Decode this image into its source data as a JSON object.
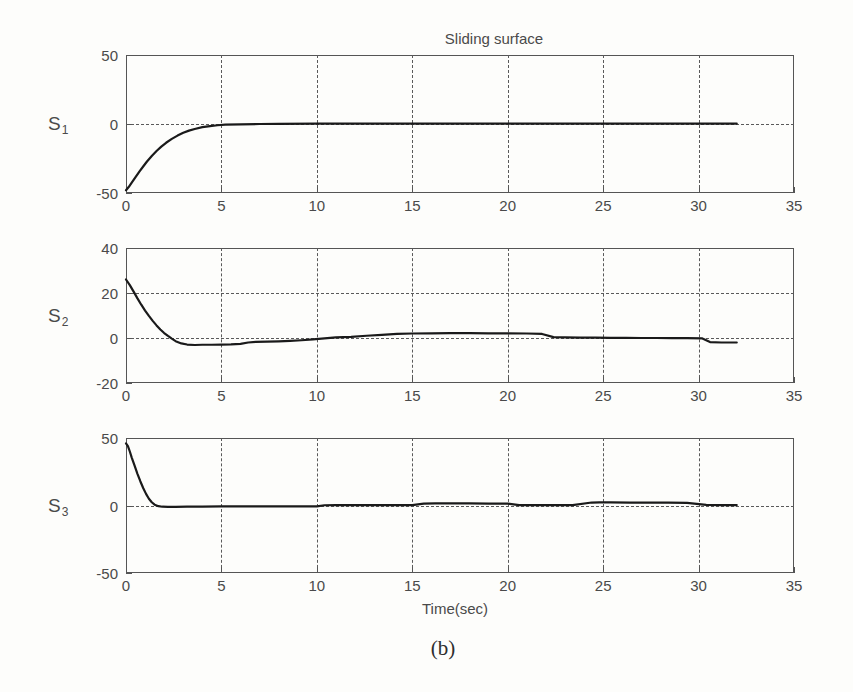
{
  "figure": {
    "title": "Sliding surface",
    "caption": "(b)",
    "xlabel": "Time(sec)"
  },
  "chart_data": {
    "type": "line",
    "title": "Sliding surface",
    "caption": "(b)",
    "xlabel": "Time(sec)",
    "ylabel": "",
    "shared_x": true,
    "xlim": [
      0,
      35
    ],
    "xticks": [
      0,
      5,
      10,
      15,
      20,
      25,
      30,
      35
    ],
    "xticklabels": [
      "0",
      "5",
      "10",
      "15",
      "20",
      "25",
      "30",
      "35"
    ],
    "grid": "dashed",
    "legend": "none",
    "subplots": [
      {
        "name": "S1",
        "ylabel": "S",
        "ylabel_sub": "1",
        "ylim": [
          -50,
          50
        ],
        "yticks": [
          -50,
          0,
          50
        ],
        "yticklabels": [
          "-50",
          "0",
          "50"
        ],
        "series": [
          {
            "name": "S1",
            "x": [
              0,
              0.15,
              0.3,
              0.5,
              0.7,
              0.9,
              1.1,
              1.35,
              1.6,
              1.85,
              2.1,
              2.4,
              2.7,
              3.0,
              3.3,
              3.6,
              4.0,
              4.4,
              4.8,
              5.2,
              6.0,
              7.0,
              8.0,
              10.0,
              12.0,
              14.0,
              16.0,
              18.0,
              20.0,
              22.0,
              24.0,
              26.0,
              28.0,
              30.0,
              31.0,
              32.0
            ],
            "y": [
              -48.0,
              -45.5,
              -42.5,
              -38.5,
              -34.5,
              -30.8,
              -27.2,
              -23.2,
              -19.6,
              -16.4,
              -13.6,
              -10.8,
              -8.4,
              -6.4,
              -4.8,
              -3.6,
              -2.3,
              -1.5,
              -0.9,
              -0.5,
              -0.2,
              0.0,
              0.1,
              0.2,
              0.2,
              0.2,
              0.2,
              0.3,
              0.2,
              0.2,
              0.2,
              0.2,
              0.2,
              0.2,
              0.2,
              0.2
            ]
          }
        ]
      },
      {
        "name": "S2",
        "ylabel": "S",
        "ylabel_sub": "2",
        "ylim": [
          -20,
          40
        ],
        "yticks": [
          -20,
          0,
          20,
          40
        ],
        "yticklabels": [
          "-20",
          "0",
          "20",
          "40"
        ],
        "series": [
          {
            "name": "S2",
            "x": [
              0,
              0.2,
              0.4,
              0.6,
              0.8,
              1.0,
              1.2,
              1.4,
              1.6,
              1.8,
              2.0,
              2.2,
              2.4,
              2.6,
              2.9,
              3.2,
              3.6,
              4.0,
              4.5,
              5.0,
              5.5,
              6.0,
              6.4,
              6.8,
              7.4,
              8.0,
              8.6,
              9.2,
              9.8,
              10.4,
              11.0,
              11.8,
              12.6,
              13.4,
              14.2,
              15.0,
              16.0,
              17.0,
              18.0,
              19.0,
              20.0,
              21.0,
              21.8,
              22.4,
              23.0,
              23.8,
              24.6,
              25.4,
              26.2,
              27.0,
              27.8,
              28.6,
              29.4,
              30.2,
              30.6,
              31.2,
              32.0
            ],
            "y": [
              26.0,
              23.5,
              20.6,
              17.6,
              14.8,
              12.2,
              9.8,
              7.6,
              5.6,
              3.8,
              2.2,
              0.9,
              -0.3,
              -1.4,
              -2.4,
              -2.9,
              -3.1,
              -3.0,
              -3.0,
              -2.9,
              -2.8,
              -2.6,
              -2.0,
              -1.7,
              -1.6,
              -1.5,
              -1.3,
              -1.0,
              -0.6,
              -0.2,
              0.3,
              0.5,
              1.0,
              1.4,
              1.8,
              2.0,
              2.1,
              2.2,
              2.2,
              2.1,
              2.1,
              2.0,
              1.8,
              0.4,
              0.3,
              0.2,
              0.2,
              0.1,
              0.1,
              0.0,
              0.0,
              -0.1,
              -0.1,
              -0.2,
              -1.8,
              -2.0,
              -2.0
            ]
          }
        ]
      },
      {
        "name": "S3",
        "ylabel": "S",
        "ylabel_sub": "3",
        "ylim": [
          -50,
          50
        ],
        "yticks": [
          -50,
          0,
          50
        ],
        "yticklabels": [
          "-50",
          "0",
          "50"
        ],
        "series": [
          {
            "name": "S3",
            "x": [
              0,
              0.1,
              0.2,
              0.3,
              0.45,
              0.6,
              0.75,
              0.9,
              1.05,
              1.2,
              1.35,
              1.5,
              1.7,
              1.9,
              2.2,
              2.6,
              3.2,
              4.0,
              5.0,
              6.0,
              7.5,
              9.0,
              10.0,
              10.4,
              11.0,
              12.0,
              13.0,
              14.0,
              15.0,
              15.6,
              16.2,
              17.0,
              18.0,
              19.0,
              20.0,
              20.6,
              21.4,
              22.4,
              23.4,
              24.4,
              24.8,
              25.4,
              26.4,
              27.4,
              28.4,
              29.4,
              30.4,
              31.2,
              32.0
            ],
            "y": [
              46.0,
              44.0,
              40.0,
              35.5,
              29.5,
              23.5,
              18.0,
              13.0,
              8.6,
              5.0,
              2.4,
              0.6,
              -0.5,
              -0.9,
              -1.0,
              -1.0,
              -0.9,
              -0.8,
              -0.7,
              -0.6,
              -0.6,
              -0.6,
              -0.6,
              0.2,
              0.3,
              0.3,
              0.3,
              0.3,
              0.3,
              1.4,
              1.5,
              1.5,
              1.5,
              1.4,
              1.4,
              0.3,
              0.3,
              0.3,
              0.3,
              2.2,
              2.3,
              2.3,
              2.2,
              2.2,
              2.1,
              2.0,
              0.4,
              0.3,
              0.3
            ]
          }
        ]
      }
    ]
  }
}
